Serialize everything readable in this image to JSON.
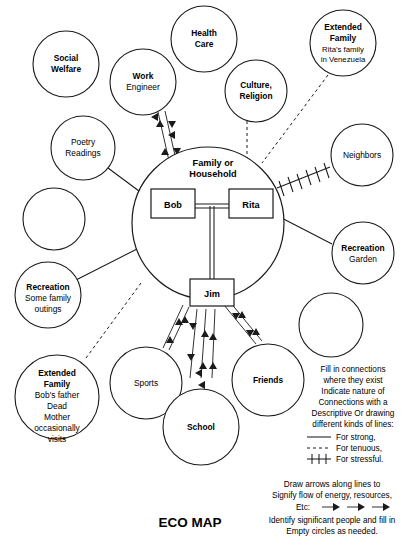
{
  "diagram": {
    "title": "ECO MAP",
    "central": {
      "label_line1": "Family or",
      "label_line2": "Household",
      "members": [
        {
          "name": "Bob"
        },
        {
          "name": "Rita"
        },
        {
          "name": "Jim"
        }
      ]
    },
    "nodes": [
      {
        "id": "social-welfare",
        "lines": [
          {
            "text": "Social",
            "bold": true
          },
          {
            "text": "Welfare",
            "bold": true
          }
        ]
      },
      {
        "id": "health-care",
        "lines": [
          {
            "text": "Health",
            "bold": true
          },
          {
            "text": "Care",
            "bold": true
          }
        ]
      },
      {
        "id": "extended-family-rita",
        "lines": [
          {
            "text": "Extended",
            "bold": true
          },
          {
            "text": "Family",
            "bold": true
          },
          {
            "text": "Rita's family",
            "bold": false
          },
          {
            "text": "in Venezuela",
            "bold": false
          }
        ]
      },
      {
        "id": "work",
        "lines": [
          {
            "text": "Work",
            "bold": true
          },
          {
            "text": "Engineer",
            "bold": false
          }
        ]
      },
      {
        "id": "culture-religion",
        "lines": [
          {
            "text": "Culture,",
            "bold": true
          },
          {
            "text": "Religion",
            "bold": true
          }
        ]
      },
      {
        "id": "poetry-readings",
        "lines": [
          {
            "text": "Poetry",
            "bold": false
          },
          {
            "text": "Readings",
            "bold": false
          }
        ]
      },
      {
        "id": "neighbors",
        "lines": [
          {
            "text": "Neighbors",
            "bold": false
          }
        ]
      },
      {
        "id": "empty-left-upper",
        "lines": []
      },
      {
        "id": "recreation-garden",
        "lines": [
          {
            "text": "Recreation",
            "bold": true
          },
          {
            "text": "Garden",
            "bold": false
          }
        ]
      },
      {
        "id": "recreation-outings",
        "lines": [
          {
            "text": "Recreation",
            "bold": true
          },
          {
            "text": "Some family",
            "bold": false
          },
          {
            "text": "outings",
            "bold": false
          }
        ]
      },
      {
        "id": "extended-family-bob",
        "lines": [
          {
            "text": "Extended",
            "bold": true
          },
          {
            "text": "Family",
            "bold": true
          },
          {
            "text": "Bob's father",
            "bold": false
          },
          {
            "text": "Dead",
            "bold": false
          },
          {
            "text": "Mother",
            "bold": false
          },
          {
            "text": "occasionally",
            "bold": false
          },
          {
            "text": "visits",
            "bold": false
          }
        ]
      },
      {
        "id": "sports",
        "lines": [
          {
            "text": "Sports",
            "bold": false
          }
        ]
      },
      {
        "id": "school",
        "lines": [
          {
            "text": "School",
            "bold": true
          }
        ]
      },
      {
        "id": "friends",
        "lines": [
          {
            "text": "Friends",
            "bold": true
          }
        ]
      },
      {
        "id": "empty-right-lower",
        "lines": []
      }
    ]
  },
  "legend": {
    "instructions": [
      "Fill in connections",
      "where they exist",
      "Indicate nature of",
      "Connections with a",
      "Descriptive Or drawing",
      "different kinds of lines:"
    ],
    "keys": [
      {
        "style": "solid",
        "label": "For strong,"
      },
      {
        "style": "dashed",
        "label": "For tenuous,"
      },
      {
        "style": "hatched",
        "label": "For stressful."
      }
    ],
    "footer": [
      "Draw arrows along lines to",
      "Signify flow of energy, resources,"
    ],
    "etc_label": "Etc:",
    "footer2": [
      "Identify significant people and fill in",
      "Empty circles as needed."
    ]
  },
  "colors": {
    "ink": "#1a1a1a",
    "paper": "#ffffff"
  }
}
